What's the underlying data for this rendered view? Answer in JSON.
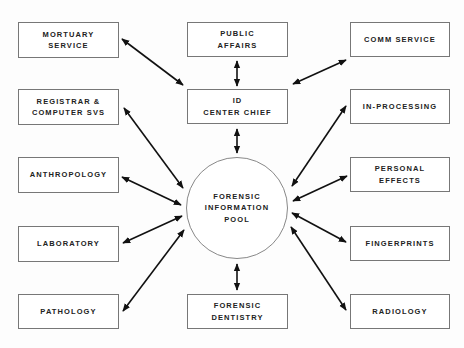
{
  "diagram": {
    "center": {
      "label": "FORENSIC\nINFORMATION\nPOOL"
    },
    "nodes": {
      "mortuary": "MORTUARY\nSERVICE",
      "public_affairs": "PUBLIC\nAFFAIRS",
      "comm": "COMM SERVICE",
      "registrar": "REGISTRAR &\nCOMPUTER SVS",
      "id_chief": "ID\nCENTER CHIEF",
      "in_processing": "IN-PROCESSING",
      "anthropology": "ANTHROPOLOGY",
      "personal_effects": "PERSONAL\nEFFECTS",
      "laboratory": "LABORATORY",
      "fingerprints": "FINGERPRINTS",
      "pathology": "PATHOLOGY",
      "dentistry": "FORENSIC\nDENTISTRY",
      "radiology": "RADIOLOGY"
    },
    "connections": [
      [
        "mortuary",
        "id_chief"
      ],
      [
        "public_affairs",
        "id_chief"
      ],
      [
        "comm",
        "id_chief"
      ],
      [
        "id_chief",
        "center"
      ],
      [
        "registrar",
        "center"
      ],
      [
        "in_processing",
        "center"
      ],
      [
        "anthropology",
        "center"
      ],
      [
        "personal_effects",
        "center"
      ],
      [
        "laboratory",
        "center"
      ],
      [
        "fingerprints",
        "center"
      ],
      [
        "pathology",
        "center"
      ],
      [
        "radiology",
        "center"
      ],
      [
        "dentistry",
        "center"
      ]
    ]
  }
}
